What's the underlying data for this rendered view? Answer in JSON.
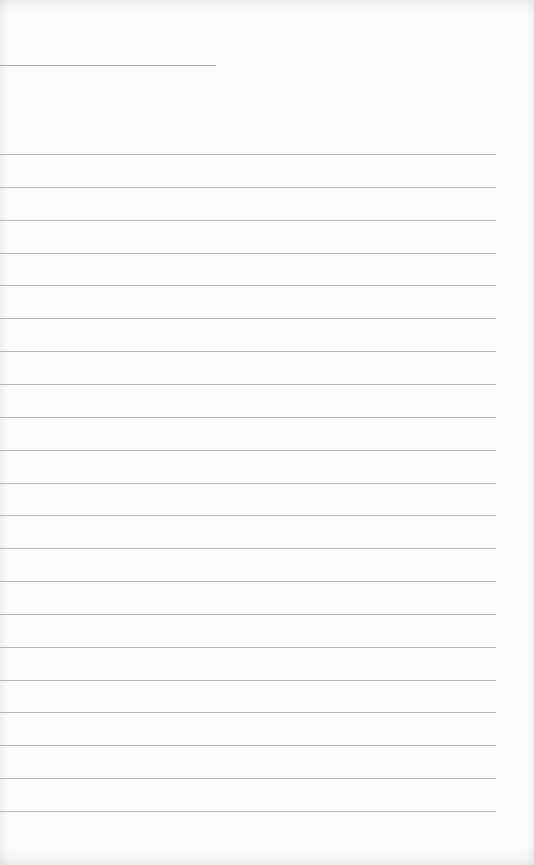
{
  "document": {
    "type": "lined-paper",
    "title_line": {
      "text": ""
    },
    "ruled_lines": {
      "count": 21,
      "first_y": 154,
      "spacing": 32.85,
      "color": "#b8b8b8",
      "entries": [
        "",
        "",
        "",
        "",
        "",
        "",
        "",
        "",
        "",
        "",
        "",
        "",
        "",
        "",
        "",
        "",
        "",
        "",
        "",
        "",
        ""
      ]
    },
    "paper_color": "#fdfdfd"
  }
}
